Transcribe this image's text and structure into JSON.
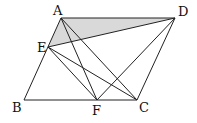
{
  "diagram": {
    "points": {
      "A": {
        "x": 61,
        "y": 18,
        "label": "A",
        "lx": 53,
        "ly": 15
      },
      "D": {
        "x": 175,
        "y": 18,
        "label": "D",
        "lx": 178,
        "ly": 16
      },
      "E": {
        "x": 48,
        "y": 47,
        "label": "E",
        "lx": 37,
        "ly": 52
      },
      "B": {
        "x": 24,
        "y": 100,
        "label": "B",
        "lx": 12,
        "ly": 112
      },
      "F": {
        "x": 97,
        "y": 100,
        "label": "F",
        "lx": 92,
        "ly": 115
      },
      "C": {
        "x": 137,
        "y": 100,
        "label": "C",
        "lx": 139,
        "ly": 112
      }
    },
    "segments": [
      [
        "A",
        "D"
      ],
      [
        "A",
        "B"
      ],
      [
        "B",
        "C"
      ],
      [
        "C",
        "D"
      ],
      [
        "E",
        "D"
      ],
      [
        "A",
        "F"
      ],
      [
        "A",
        "C"
      ],
      [
        "E",
        "F"
      ],
      [
        "E",
        "C"
      ],
      [
        "F",
        "D"
      ]
    ],
    "shaded": [
      "A",
      "E",
      "D"
    ],
    "shade_color": "#d9d9d9",
    "line_color": "#222222"
  }
}
